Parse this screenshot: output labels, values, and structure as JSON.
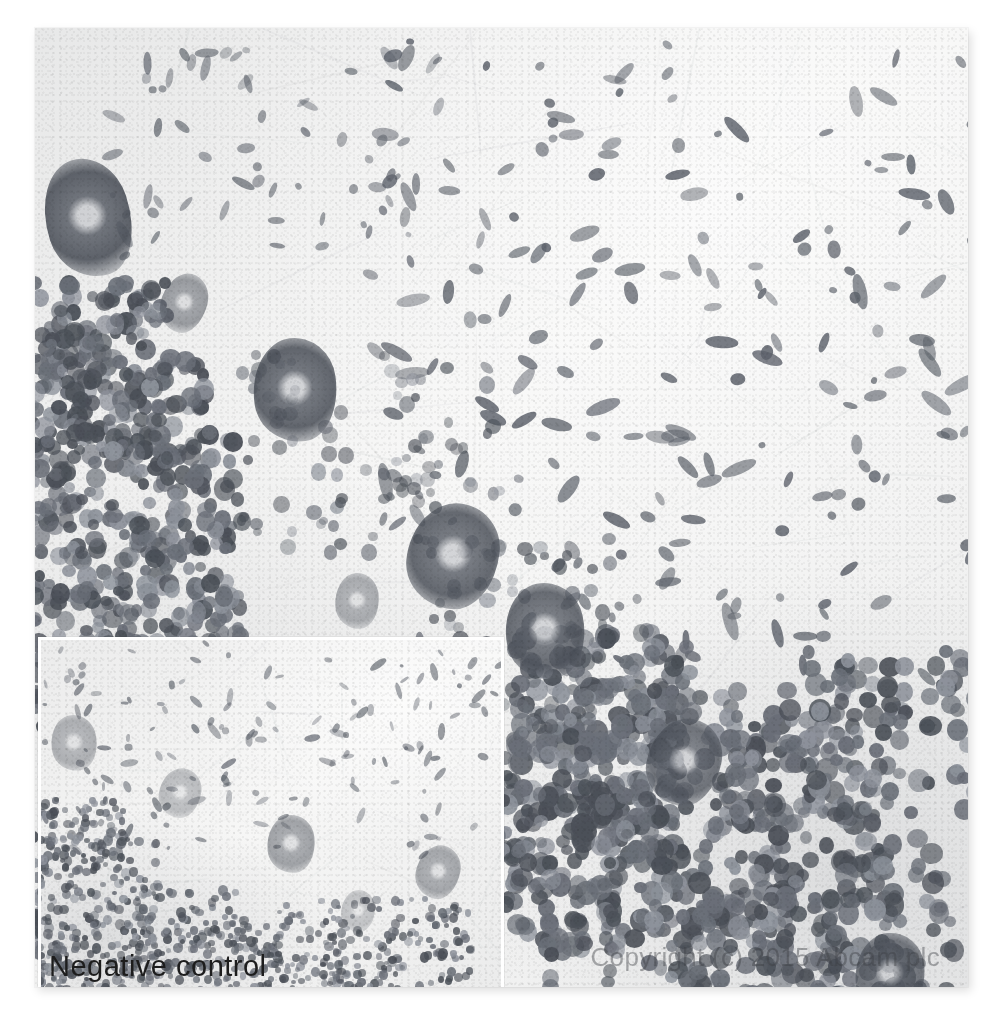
{
  "image": {
    "kind": "immunohistochemistry-micrograph",
    "tissue": "cerebellum",
    "stain": "DAB chromogen, greyscale",
    "alt": "Immunohistochemical staining of cerebellum tissue showing darkly stained Purkinje cell bodies and a dense granule cell layer, with a paler negative control inset at lower left"
  },
  "overlays": {
    "inset_label": "Negative control",
    "copyright": "Copyright (c) 2015 Abcam plc"
  },
  "colors": {
    "page_background": "#ffffff",
    "plate_background": "#f4f4f3",
    "inset_background": "#f3f3f2",
    "inset_border": "#ffffff",
    "cell_dark": "#4b5058",
    "cell_mid": "#6a6f78",
    "cell_light": "#8d929b",
    "label_text": "#1d1d1d",
    "copyright_text": "rgba(60,62,66,0.42)"
  },
  "layout": {
    "plate": {
      "left": 35,
      "top": 28,
      "width": 933,
      "height": 959
    },
    "inset": {
      "left": 38,
      "top": 637,
      "width": 460,
      "height": 347
    }
  },
  "regions": [
    {
      "name": "molecular-layer",
      "description": "pale upper-right field with sparse spindle-shaped nuclei"
    },
    {
      "name": "purkinje-cell-layer",
      "description": "diagonal band of large darkly stained neuronal somata"
    },
    {
      "name": "granule-cell-layer",
      "description": "dense clusters of small round dark nuclei in lower-left and lower-right"
    }
  ]
}
